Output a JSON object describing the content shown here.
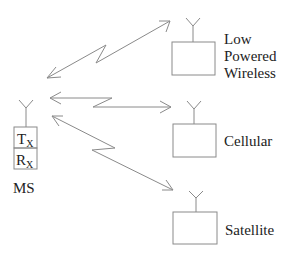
{
  "diagram": {
    "colors": {
      "line": "#8a8a8a",
      "text": "#222222",
      "background": "#ffffff"
    },
    "mobile_station": {
      "label": "MS",
      "tx_label": "T",
      "tx_sub": "X",
      "rx_label": "R",
      "rx_sub": "X"
    },
    "networks": [
      {
        "label_lines": [
          "Low",
          "Powered",
          "Wireless"
        ]
      },
      {
        "label_lines": [
          "Cellular"
        ]
      },
      {
        "label_lines": [
          "Satellite"
        ]
      }
    ],
    "links": [
      {
        "from": "MS",
        "to": "Low Powered Wireless",
        "type": "bidirectional-wireless"
      },
      {
        "from": "MS",
        "to": "Cellular",
        "type": "bidirectional-wireless"
      },
      {
        "from": "MS",
        "to": "Satellite",
        "type": "bidirectional-wireless"
      }
    ]
  }
}
